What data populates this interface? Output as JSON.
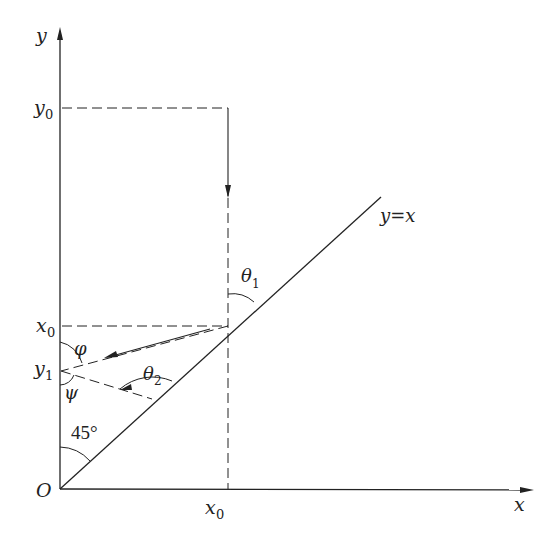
{
  "diagram": {
    "axes": {
      "x_label": "x",
      "y_label": "y",
      "origin_label": "O"
    },
    "line_label": "y=x",
    "points": {
      "y0": {
        "base": "y",
        "sub": "0"
      },
      "x0_on_y_axis": {
        "base": "x",
        "sub": "0"
      },
      "y1": {
        "base": "y",
        "sub": "1"
      },
      "x0_on_x_axis": {
        "base": "x",
        "sub": "0"
      }
    },
    "angles": {
      "theta1": {
        "base": "θ",
        "sub": "1"
      },
      "theta2": {
        "base": "θ",
        "sub": "2"
      },
      "phi": "φ",
      "psi": "ψ",
      "forty_five": "45°"
    },
    "colors": {
      "stroke": "#222222",
      "background": "#ffffff"
    }
  }
}
